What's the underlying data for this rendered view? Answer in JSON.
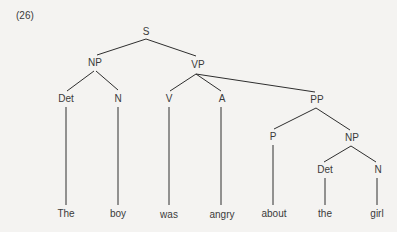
{
  "example_number": "(26)",
  "tree": {
    "nodes": {
      "S": "S",
      "NP1": "NP",
      "VP": "VP",
      "Det1": "Det",
      "N1": "N",
      "V": "V",
      "A": "A",
      "PP": "PP",
      "P": "P",
      "NP2": "NP",
      "Det2": "Det",
      "N2": "N"
    },
    "words": {
      "w1": "The",
      "w2": "boy",
      "w3": "was",
      "w4": "angry",
      "w5": "about",
      "w6": "the",
      "w7": "girl"
    },
    "line_color": "#2e2e2e"
  }
}
